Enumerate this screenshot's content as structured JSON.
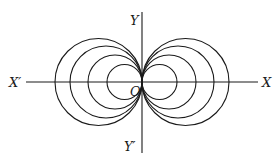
{
  "diagram": {
    "type": "coaxal circles tangent at origin",
    "labels": {
      "x_pos": "X",
      "x_neg": "X′",
      "y_pos": "Y",
      "y_neg": "Y′",
      "origin": "O"
    },
    "origin": {
      "x": 142,
      "y": 82
    },
    "radii": [
      17.5,
      27,
      36,
      43.5
    ],
    "stroke_color": "#1a1a1a"
  }
}
